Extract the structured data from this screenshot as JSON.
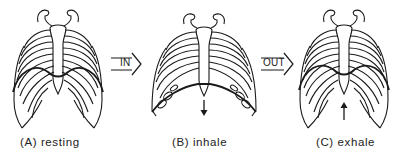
{
  "diagram": {
    "panels": [
      {
        "id": "A",
        "label": "(A) resting",
        "state": "resting",
        "diaphragm_arrow": "none"
      },
      {
        "id": "B",
        "label": "(B) inhale",
        "state": "inhale",
        "diaphragm_arrow": "down"
      },
      {
        "id": "C",
        "label": "(C) exhale",
        "state": "exhale",
        "diaphragm_arrow": "up"
      }
    ],
    "transitions": [
      {
        "from": "A",
        "to": "B",
        "label": "IN"
      },
      {
        "from": "B",
        "to": "C",
        "label": "OUT"
      }
    ],
    "colors": {
      "line": "#1a1a1a",
      "background": "#ffffff"
    }
  }
}
